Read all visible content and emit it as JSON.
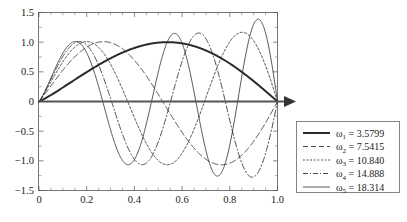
{
  "chart_data": {
    "type": "line",
    "title": "",
    "xlabel": "",
    "ylabel": "",
    "xlim": [
      0,
      1.0
    ],
    "ylim": [
      -1.5,
      1.5
    ],
    "grid": false,
    "legend_position": "right-outside",
    "xticks": [
      "0",
      "0.2",
      "0.4",
      "0.6",
      "0.8",
      "1.0"
    ],
    "xtick_values": [
      0,
      0.2,
      0.4,
      0.6,
      0.8,
      1.0
    ],
    "yticks": [
      "1.5",
      "1.0",
      "0.5",
      "0",
      "-0.5",
      "-1.0",
      "-1.5"
    ],
    "ytick_values": [
      1.5,
      1.0,
      0.5,
      0,
      -0.5,
      -1.0,
      -1.5
    ],
    "annotations": [
      "x-axis arrow at right end of zero line"
    ],
    "series": [
      {
        "name": "omega-1",
        "legend_symbol": "ω",
        "legend_subscript": "1",
        "legend_equals": "=",
        "legend_value": "3.5799",
        "omega": 3.5799,
        "style": "solid-thick",
        "peak": 1.0,
        "peak_x": 0.43,
        "zeros": [
          0.0,
          1.0
        ]
      },
      {
        "name": "omega-2",
        "legend_symbol": "ω",
        "legend_subscript": "2",
        "legend_equals": "=",
        "legend_value": "7.5415",
        "omega": 7.5415,
        "style": "dashed",
        "peak": 1.0,
        "peak_x": 0.2,
        "trough": -1.34,
        "trough_x": 0.66,
        "zeros": [
          0.0,
          0.42,
          1.0
        ]
      },
      {
        "name": "omega-3",
        "legend_symbol": "ω",
        "legend_subscript": "3",
        "legend_equals": "=",
        "legend_value": "10.840",
        "omega": 10.84,
        "style": "dotted",
        "peak": 1.18,
        "peak_x": 0.79,
        "trough": -1.03,
        "trough_x": 0.45,
        "zeros": [
          0.0,
          0.29,
          0.62,
          1.0
        ]
      },
      {
        "name": "omega-4",
        "legend_symbol": "ω",
        "legend_subscript": "4",
        "legend_equals": "=",
        "legend_value": "14.888",
        "omega": 14.888,
        "style": "dash-dot",
        "peak": 1.0,
        "peak_x": 0.1,
        "trough": -1.02,
        "trough_x": 0.32,
        "zeros": [
          0.0,
          0.21,
          0.43,
          0.64,
          0.85,
          1.0
        ]
      },
      {
        "name": "omega-5",
        "legend_symbol": "ω",
        "legend_subscript": "5",
        "legend_equals": "=",
        "legend_value": "18.314",
        "omega": 18.314,
        "style": "solid-thin",
        "peak": 1.4,
        "peak_x": 0.88,
        "trough": -1.41,
        "trough_x": 0.63,
        "zeros": [
          0.0,
          0.17,
          0.35,
          0.52,
          0.7,
          0.87,
          1.0
        ]
      }
    ]
  }
}
